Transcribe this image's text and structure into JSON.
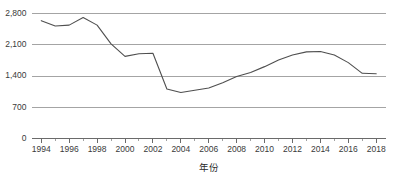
{
  "chart_data": {
    "type": "line",
    "title": "",
    "subtitle": "",
    "xlabel": "年份",
    "ylabel": "",
    "xlim": [
      1993.3,
      2018.7
    ],
    "ylim": [
      0,
      2800
    ],
    "grid": true,
    "grid_axis": "y",
    "legend": false,
    "legend_position": "none",
    "x": [
      1994,
      1995,
      1996,
      1997,
      1998,
      1999,
      2000,
      2001,
      2002,
      2003,
      2004,
      2005,
      2006,
      2007,
      2008,
      2009,
      2010,
      2011,
      2012,
      2013,
      2014,
      2015,
      2016,
      2017,
      2018
    ],
    "categories": [
      "1994",
      "1995",
      "1996",
      "1997",
      "1998",
      "1999",
      "2000",
      "2001",
      "2002",
      "2003",
      "2004",
      "2005",
      "2006",
      "2007",
      "2008",
      "2009",
      "2010",
      "2011",
      "2012",
      "2013",
      "2014",
      "2015",
      "2016",
      "2017",
      "2018"
    ],
    "values": [
      2640,
      2520,
      2540,
      2710,
      2540,
      2120,
      1840,
      1900,
      1910,
      1110,
      1030,
      1080,
      1130,
      1250,
      1390,
      1480,
      1610,
      1760,
      1870,
      1940,
      1950,
      1870,
      1700,
      1460,
      1450
    ],
    "series": [
      {
        "name": "series-1",
        "color": "#4f4f4f",
        "values": [
          2640,
          2520,
          2540,
          2710,
          2540,
          2120,
          1840,
          1900,
          1910,
          1110,
          1030,
          1080,
          1130,
          1250,
          1390,
          1480,
          1610,
          1760,
          1870,
          1940,
          1950,
          1870,
          1700,
          1460,
          1450
        ]
      }
    ],
    "y_ticks": [
      0,
      700,
      1400,
      2100,
      2800
    ],
    "y_tick_labels": [
      "0",
      "700",
      "1,400",
      "2,100",
      "2,800"
    ],
    "x_ticks_major": [
      1994,
      1996,
      1998,
      2000,
      2002,
      2004,
      2006,
      2008,
      2010,
      2012,
      2014,
      2016,
      2018
    ],
    "x_tick_labels_major": [
      "1994",
      "1996",
      "1998",
      "2000",
      "2002",
      "2004",
      "2006",
      "2008",
      "2010",
      "2012",
      "2014",
      "2016",
      "2018"
    ],
    "x_ticks_minor": [
      1995,
      1997,
      1999,
      2001,
      2003,
      2005,
      2007,
      2009,
      2011,
      2013,
      2015,
      2017
    ],
    "annotations": []
  },
  "colors": {
    "background": "#ffffff",
    "line": "#4f4f4f",
    "gridline": "#9a9a9a",
    "axis": "#5a5a5a",
    "tick_text": "#3a3a3a",
    "axis_title": "#2b2b2b"
  }
}
